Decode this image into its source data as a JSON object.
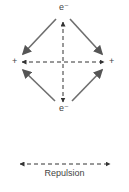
{
  "diagram": {
    "labels": {
      "top_charge": "e⁻",
      "bottom_charge": "e⁻",
      "left_charge": "+",
      "right_charge": "+"
    },
    "legend": {
      "caption": "Repulsion"
    },
    "colors": {
      "attraction_arrow": "#6e6e6e",
      "repulsion_arrow": "#333333",
      "text": "#444444"
    }
  }
}
